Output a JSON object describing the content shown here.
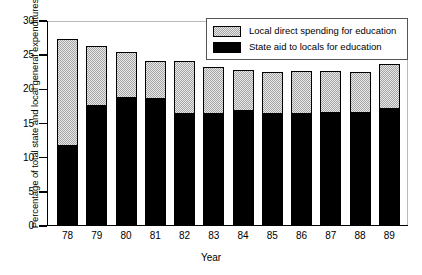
{
  "chart_data": {
    "type": "bar",
    "subtype": "stacked",
    "title": "",
    "xlabel": "Year",
    "ylabel": "Percentage of total state and local general expenditures",
    "categories": [
      "78",
      "79",
      "80",
      "81",
      "82",
      "83",
      "84",
      "85",
      "86",
      "87",
      "88",
      "89"
    ],
    "ylim": [
      0,
      30
    ],
    "yticks": [
      0,
      5,
      10,
      15,
      20,
      25,
      30
    ],
    "grid": false,
    "legend_position": "top-right",
    "series": [
      {
        "name": "State aid to locals for education",
        "color": "#000000",
        "values": [
          11.8,
          17.7,
          18.9,
          18.7,
          16.6,
          16.6,
          17.0,
          16.6,
          16.6,
          16.7,
          16.7,
          17.2
        ]
      },
      {
        "name": "Local direct spending for education",
        "color": "#a5a5a5",
        "values": [
          15.5,
          8.7,
          6.5,
          5.5,
          7.6,
          6.7,
          5.9,
          5.9,
          6.1,
          6.0,
          5.8,
          6.5
        ]
      }
    ],
    "totals": [
      27.3,
      26.4,
      25.4,
      24.2,
      24.2,
      23.3,
      22.9,
      22.5,
      22.7,
      22.7,
      22.5,
      23.7
    ]
  },
  "legend": {
    "items": [
      {
        "label": "Local direct spending for education",
        "swatch": "gray-hatch"
      },
      {
        "label": "State aid to locals for education",
        "swatch": "black"
      }
    ]
  },
  "axes": {
    "y_labels": [
      "30",
      "25",
      "20",
      "15",
      "10",
      "5",
      "0"
    ],
    "x_labels": [
      "78",
      "79",
      "80",
      "81",
      "82",
      "83",
      "84",
      "85",
      "86",
      "87",
      "88",
      "89"
    ],
    "x_title": "Year",
    "y_title": "Percentage of total state and local general expenditures"
  }
}
